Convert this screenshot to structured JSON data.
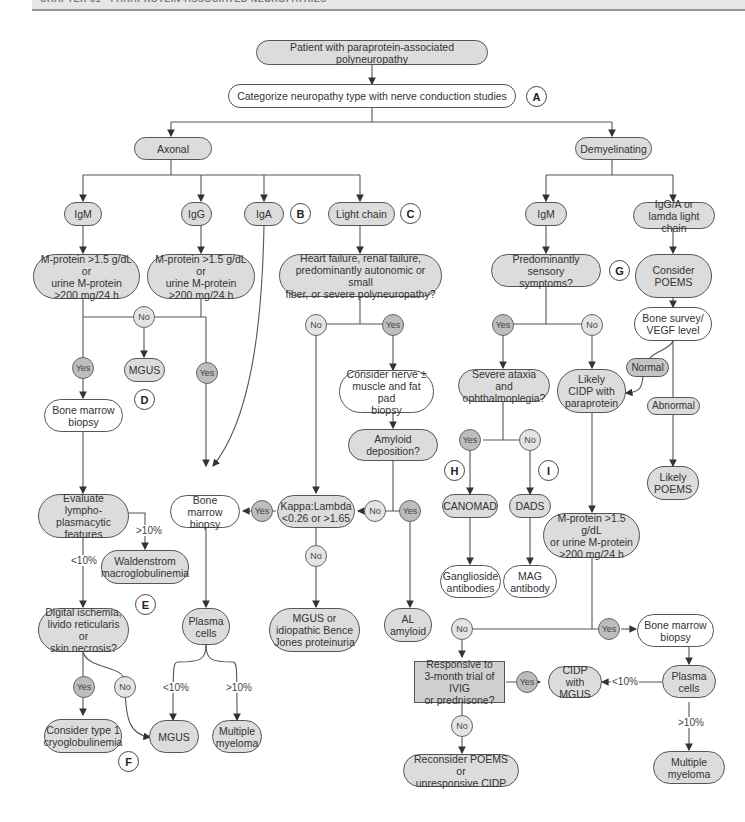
{
  "header": {
    "chapter": "CHAPTER 31 · PARAPROTEIN-ASSOCIATED NEUROPATHIES"
  },
  "nodes": {
    "start": "Patient with paraprotein-associated polyneuropathy",
    "categorize": "Categorize neuropathy type with nerve conduction studies",
    "axonal": "Axonal",
    "demyelinating": "Demyelinating",
    "igm_ax": "IgM",
    "igg_ax": "IgG",
    "iga_ax": "IgA",
    "light_chain": "Light chain",
    "mprot_igm": "M-protein >1.5 g/dL or\nurine M-protein\n>200 mg/24 h",
    "mprot_igg": "M-protein >1.5 g/dL or\nurine M-protein\n>200 mg/24 h",
    "heart_failure": "Heart failure, renal failure,\npredominantly autonomic or small\nfiber, or severe polyneuropathy?",
    "mgus_d": "MGUS",
    "bmb_left": "Bone marrow\nbiopsy",
    "consider_nerve": "Consider nerve ±\nmuscle and fat pad\nbiopsy",
    "amyloid": "Amyloid\ndeposition?",
    "evaluate_lympho": "Evaluate lympho-\nplasmacytic\nfeatures",
    "waldenstrom": "Waldenstrom\nmacroglobulinemia",
    "bmb_mid": "Bone marrow\nbiopsy",
    "kappa_lambda": "Kappa:Lambda\n<0.26 or >1.65",
    "al_amyloid": "AL\namyloid",
    "mgus_bence": "MGUS or\nidiopathic Bence\nJones proteinuria",
    "digital_ischemia": "Digital ischemia,\nlivido reticularis or\nskin necrosis?",
    "plasma_mid": "Plasma\ncells",
    "cryo": "Consider type 1\ncryoglobulinemia",
    "mgus_bottom": "MGUS",
    "myeloma_mid": "Multiple\nmyeloma",
    "igm_dem": "IgM",
    "igga_lambda": "IgG/A or\nlamda light chain",
    "sensory": "Predominantly sensory\nsymptoms?",
    "consider_poems": "Consider\nPOEMS",
    "bone_survey": "Bone survey/\nVEGF level",
    "normal": "Normal",
    "abnormal": "Abnormal",
    "likely_poems": "Likely\nPOEMS",
    "severe_ataxia": "Severe ataxia and\nophthalmoplegia?",
    "likely_cidp": "Likely\nCIDP with\nparaprotein",
    "canomad": "CANOMAD",
    "dads": "DADS",
    "ganglioside": "Ganglioside\nantibodies",
    "mag": "MAG\nantibody",
    "mprot_dem": "M-protein >1.5 g/dL\nor urine M-protein\n>200 mg/24 h",
    "bmb_right": "Bone marrow\nbiopsy",
    "responsive": "Responsive to\n3-month trial of IVIG\nor prednisone?",
    "cidp_mgus": "CIDP with\nMGUS",
    "plasma_right": "Plasma\ncells",
    "reconsider": "Reconsider POEMS or\nunresponsive CIDP",
    "myeloma_right": "Multiple\nmyeloma"
  },
  "decisions": {
    "yes": "Yes",
    "no": "No"
  },
  "thresholds": {
    "lt10": "<10%",
    "gt10": ">10%"
  },
  "letters": [
    "A",
    "B",
    "C",
    "D",
    "E",
    "F",
    "G",
    "H",
    "I"
  ]
}
